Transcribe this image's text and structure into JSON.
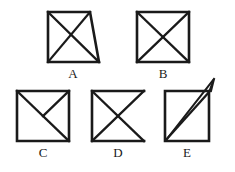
{
  "page": {
    "background_color": "#ffffff",
    "stroke_color": "#1a1a1a",
    "width": 235,
    "height": 172
  },
  "figures": [
    {
      "id": "A",
      "label": "A",
      "description": "Trapezoid with shorter top edge and slanted right side, containing both diagonals",
      "shape": "trapezoid",
      "outline_points": "48,12 90,12 99,62 48,62",
      "inner_lines": [
        {
          "name": "diagonal-top-left-to-bottom-right",
          "x1": 48,
          "y1": 12,
          "x2": 99,
          "y2": 62
        },
        {
          "name": "diagonal-top-right-to-bottom-left",
          "x1": 90,
          "y1": 12,
          "x2": 48,
          "y2": 62
        }
      ],
      "label_x": 73,
      "label_y": 78
    },
    {
      "id": "B",
      "label": "B",
      "description": "Complete square with both diagonals forming an X",
      "shape": "square",
      "outline_points": "137,12 189,12 189,62 137,62",
      "inner_lines": [
        {
          "name": "diagonal-top-left-to-bottom-right",
          "x1": 137,
          "y1": 12,
          "x2": 189,
          "y2": 62
        },
        {
          "name": "diagonal-top-right-to-bottom-left",
          "x1": 189,
          "y1": 12,
          "x2": 137,
          "y2": 62
        }
      ],
      "label_x": 163,
      "label_y": 78
    },
    {
      "id": "C",
      "label": "C",
      "description": "Square with main diagonal from top-left to bottom-right plus a segment from top-right to center",
      "shape": "square",
      "outline_points": "17,91 69,91 69,141 17,141",
      "inner_lines": [
        {
          "name": "diagonal-top-left-to-bottom-right",
          "x1": 17,
          "y1": 91,
          "x2": 69,
          "y2": 141
        },
        {
          "name": "half-diagonal-top-right-to-center",
          "x1": 69,
          "y1": 91,
          "x2": 43,
          "y2": 116
        }
      ],
      "label_x": 43,
      "label_y": 157
    },
    {
      "id": "D",
      "label": "D",
      "description": "Square missing its right edge, with both diagonals forming an X",
      "shape": "open-square",
      "outline_points": "92,91 144,91 144,91 92,91",
      "open_path": "M144,91 L92,91 L92,141 L144,141",
      "inner_lines": [
        {
          "name": "diagonal-top-left-to-bottom-right",
          "x1": 92,
          "y1": 91,
          "x2": 144,
          "y2": 141
        },
        {
          "name": "diagonal-top-right-to-bottom-left",
          "x1": 144,
          "y1": 91,
          "x2": 92,
          "y2": 141
        }
      ],
      "label_x": 118,
      "label_y": 157
    },
    {
      "id": "E",
      "label": "E",
      "description": "Square with a bottom-left to top-right diagonal plus a second line from bottom-left overshooting past the top-right corner",
      "shape": "square",
      "outline_points": "165,91 209,91 209,141 165,141",
      "inner_lines": [
        {
          "name": "diagonal-bottom-left-to-top-right",
          "x1": 166,
          "y1": 140,
          "x2": 209,
          "y2": 92
        },
        {
          "name": "overshoot-line-bottom-left-to-spike",
          "x1": 166,
          "y1": 140,
          "x2": 214,
          "y2": 79
        }
      ],
      "spike_path": "M209,92 L214,79 L211,91",
      "label_x": 187,
      "label_y": 157
    }
  ]
}
